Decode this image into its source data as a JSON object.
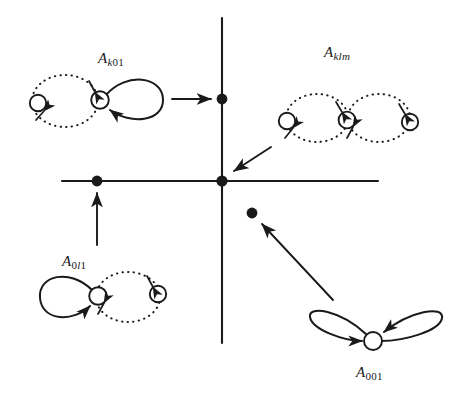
{
  "figure": {
    "background_color": "#ffffff",
    "ink_color": "#1a1a1a",
    "width": 457,
    "height": 395
  },
  "axes": {
    "horizontal": {
      "y": 181,
      "x_start": 62,
      "x_end": 378
    },
    "vertical": {
      "x": 222,
      "y_start": 18,
      "y_end": 343
    }
  },
  "points": [
    {
      "name": "origin-point",
      "x": 222,
      "y": 181,
      "radius": 5.6
    },
    {
      "name": "vertical-axis-point",
      "x": 222,
      "y": 99,
      "radius": 5.4
    },
    {
      "name": "horizontal-axis-point",
      "x": 97,
      "y": 181,
      "radius": 5.4
    },
    {
      "name": "quadrant-four-point",
      "x": 252,
      "y": 213,
      "radius": 5.4
    }
  ],
  "graphs": [
    {
      "id": "a-k01",
      "label": "A",
      "subscript_parts": [
        {
          "text": "k",
          "italic": true
        },
        {
          "text": "01",
          "italic": false
        }
      ],
      "subscript_plain": "k01",
      "label_x": 98,
      "label_y": 50,
      "nodes": 2,
      "solid_loops": 1,
      "dotted_loops": 1
    },
    {
      "id": "a-klm",
      "label": "A",
      "subscript_parts": [
        {
          "text": "klm",
          "italic": true
        }
      ],
      "subscript_plain": "klm",
      "label_x": 324,
      "label_y": 44,
      "nodes": 3,
      "solid_loops": 0,
      "dotted_loops": 2
    },
    {
      "id": "a-0l1",
      "label": "A",
      "subscript_parts": [
        {
          "text": "0",
          "italic": false
        },
        {
          "text": "l",
          "italic": true
        },
        {
          "text": "1",
          "italic": false
        }
      ],
      "subscript_plain": "0l1",
      "label_x": 62,
      "label_y": 253,
      "nodes": 2,
      "solid_loops": 1,
      "dotted_loops": 1
    },
    {
      "id": "a-001",
      "label": "A",
      "subscript_parts": [
        {
          "text": "001",
          "italic": false
        }
      ],
      "subscript_plain": "001",
      "label_x": 356,
      "label_y": 364,
      "nodes": 1,
      "solid_loops": 2,
      "dotted_loops": 0
    }
  ],
  "arrows": [
    {
      "name": "arrow-k01-to-vertical-point",
      "from_x": 172,
      "from_y": 99,
      "to_x": 213,
      "to_y": 99
    },
    {
      "name": "arrow-klm-to-origin",
      "from_x": 271,
      "from_y": 147,
      "to_x": 232,
      "to_y": 172
    },
    {
      "name": "arrow-0l1-to-horizontal-point",
      "from_x": 97,
      "from_y": 243,
      "to_x": 97,
      "to_y": 192
    },
    {
      "name": "arrow-001-to-quadrant-point",
      "from_x": 333,
      "from_y": 300,
      "to_x": 261,
      "to_y": 223
    }
  ]
}
